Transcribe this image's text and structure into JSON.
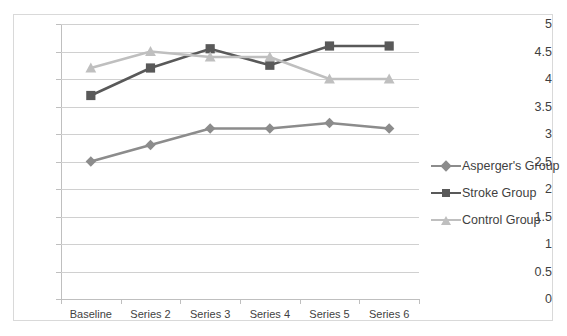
{
  "chart_data": {
    "type": "line",
    "title": "",
    "xlabel": "",
    "ylabel": "",
    "categories": [
      "Baseline",
      "Series 2",
      "Series 3",
      "Series 4",
      "Series 5",
      "Series 6"
    ],
    "ylim": [
      0,
      5
    ],
    "y_ticks": [
      "0",
      "0.5",
      "1",
      "1.5",
      "2",
      "2.5",
      "3",
      "3.5",
      "4",
      "4.5",
      "5"
    ],
    "grid": true,
    "legend_position": "right",
    "series": [
      {
        "name": "Asperger's Group",
        "color": "#8c8c8c",
        "marker": "diamond",
        "values": [
          2.5,
          2.8,
          3.1,
          3.1,
          3.2,
          3.1
        ]
      },
      {
        "name": "Stroke Group",
        "color": "#595959",
        "marker": "square",
        "values": [
          3.7,
          4.2,
          4.55,
          4.25,
          4.6,
          4.6
        ]
      },
      {
        "name": "Control Group",
        "color": "#bfbfbf",
        "marker": "triangle",
        "values": [
          4.2,
          4.5,
          4.4,
          4.4,
          4.0,
          4.0
        ]
      }
    ]
  },
  "legend": {
    "items": [
      {
        "label": "Asperger's Group"
      },
      {
        "label": "Stroke Group"
      },
      {
        "label": "Control Group"
      }
    ]
  }
}
